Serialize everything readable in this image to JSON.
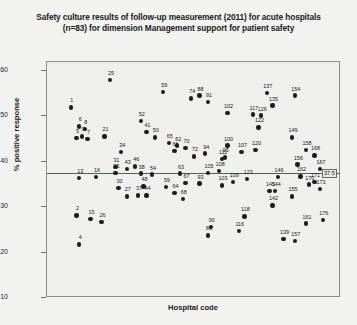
{
  "chart_data": {
    "type": "scatter",
    "title": "Safety culture results of follow-up measurement (2011) for acute hospitals (n=83) for dimension Management support for patient safety",
    "title_line1": "Safety culture results of follow-up measurement (2011) for acute hospitals",
    "title_line2": "(n=83) for dimension Management support for patient safety",
    "xlabel": "Hospital code",
    "ylabel": "% positive response",
    "ylim": [
      10,
      62
    ],
    "yticks": [
      10,
      20,
      30,
      40,
      50,
      60
    ],
    "ytick_labels": [
      "10",
      "20",
      "30",
      "40",
      "50",
      "60"
    ],
    "grid": false,
    "legend": null,
    "reference_line": {
      "value": 37.5,
      "label": "37.5",
      "orientation": "horizontal"
    },
    "point_label_field": "Hospital code",
    "points": [
      {
        "label": "1",
        "x": 6,
        "y": 52.0
      },
      {
        "label": "25",
        "x": 20,
        "y": 58.0
      },
      {
        "label": "6",
        "x": 9,
        "y": 47.8
      },
      {
        "label": "8",
        "x": 11,
        "y": 47.2
      },
      {
        "label": "5",
        "x": 8,
        "y": 45.2
      },
      {
        "label": "9",
        "x": 10,
        "y": 45.6
      },
      {
        "label": "7",
        "x": 12,
        "y": 45.0
      },
      {
        "label": "21",
        "x": 18,
        "y": 45.6
      },
      {
        "label": "34",
        "x": 24,
        "y": 42.2
      },
      {
        "label": "31",
        "x": 22,
        "y": 38.8
      },
      {
        "label": "13",
        "x": 9,
        "y": 36.4
      },
      {
        "label": "16",
        "x": 15,
        "y": 36.6
      },
      {
        "label": "35",
        "x": 22,
        "y": 37.5
      },
      {
        "label": "43",
        "x": 26,
        "y": 38.4
      },
      {
        "label": "46",
        "x": 29,
        "y": 39.0
      },
      {
        "label": "38",
        "x": 31,
        "y": 37.4
      },
      {
        "label": "54",
        "x": 35,
        "y": 37.2
      },
      {
        "label": "30",
        "x": 23,
        "y": 34.2
      },
      {
        "label": "48",
        "x": 32,
        "y": 34.6
      },
      {
        "label": "27",
        "x": 26,
        "y": 32.4
      },
      {
        "label": "37",
        "x": 30,
        "y": 32.6
      },
      {
        "label": "44",
        "x": 33,
        "y": 32.6
      },
      {
        "label": "15",
        "x": 13,
        "y": 27.4
      },
      {
        "label": "26",
        "x": 17,
        "y": 26.8
      },
      {
        "label": "2",
        "x": 8,
        "y": 28.2
      },
      {
        "label": "4",
        "x": 9,
        "y": 21.8
      },
      {
        "label": "59",
        "x": 39,
        "y": 55.4
      },
      {
        "label": "52",
        "x": 31,
        "y": 49.0
      },
      {
        "label": "88",
        "x": 52,
        "y": 54.6
      },
      {
        "label": "74",
        "x": 49,
        "y": 54.0
      },
      {
        "label": "91",
        "x": 55,
        "y": 53.2
      },
      {
        "label": "102",
        "x": 62,
        "y": 50.8
      },
      {
        "label": "50",
        "x": 36,
        "y": 45.4
      },
      {
        "label": "41",
        "x": 33,
        "y": 46.6
      },
      {
        "label": "65",
        "x": 41,
        "y": 44.2
      },
      {
        "label": "62",
        "x": 44,
        "y": 43.6
      },
      {
        "label": "70",
        "x": 47,
        "y": 43.0
      },
      {
        "label": "61",
        "x": 43,
        "y": 42.4
      },
      {
        "label": "100",
        "x": 62,
        "y": 43.6
      },
      {
        "label": "107",
        "x": 67,
        "y": 42.2
      },
      {
        "label": "95",
        "x": 61,
        "y": 41.0
      },
      {
        "label": "72",
        "x": 50,
        "y": 41.2
      },
      {
        "label": "94",
        "x": 54,
        "y": 41.8
      },
      {
        "label": "111",
        "x": 60,
        "y": 40.6
      },
      {
        "label": "63",
        "x": 45,
        "y": 37.4
      },
      {
        "label": "105",
        "x": 55,
        "y": 37.6
      },
      {
        "label": "108",
        "x": 59,
        "y": 38.0
      },
      {
        "label": "67",
        "x": 47,
        "y": 35.4
      },
      {
        "label": "93",
        "x": 52,
        "y": 35.2
      },
      {
        "label": "103",
        "x": 60,
        "y": 34.8
      },
      {
        "label": "109",
        "x": 64,
        "y": 35.6
      },
      {
        "label": "59b",
        "x": 40,
        "y": 34.4
      },
      {
        "label": "64",
        "x": 43,
        "y": 33.2
      },
      {
        "label": "68",
        "x": 46,
        "y": 31.8
      },
      {
        "label": "90",
        "x": 56,
        "y": 25.6
      },
      {
        "label": "89",
        "x": 55,
        "y": 23.8
      },
      {
        "label": "116",
        "x": 66,
        "y": 24.8
      },
      {
        "label": "137",
        "x": 76,
        "y": 55.2
      },
      {
        "label": "154",
        "x": 86,
        "y": 54.6
      },
      {
        "label": "135",
        "x": 78,
        "y": 52.4
      },
      {
        "label": "117",
        "x": 71,
        "y": 50.4
      },
      {
        "label": "126",
        "x": 74,
        "y": 50.2
      },
      {
        "label": "122",
        "x": 73,
        "y": 47.6
      },
      {
        "label": "149",
        "x": 85,
        "y": 45.4
      },
      {
        "label": "120",
        "x": 72,
        "y": 42.6
      },
      {
        "label": "158",
        "x": 90,
        "y": 42.6
      },
      {
        "label": "168",
        "x": 93,
        "y": 41.4
      },
      {
        "label": "156",
        "x": 87,
        "y": 39.4
      },
      {
        "label": "167",
        "x": 95,
        "y": 38.4
      },
      {
        "label": "123",
        "x": 69,
        "y": 36.2
      },
      {
        "label": "146",
        "x": 80,
        "y": 36.6
      },
      {
        "label": "162",
        "x": 88,
        "y": 36.8
      },
      {
        "label": "171",
        "x": 93,
        "y": 35.6
      },
      {
        "label": "170",
        "x": 91,
        "y": 35.0
      },
      {
        "label": "173",
        "x": 95,
        "y": 34.0
      },
      {
        "label": "145",
        "x": 77,
        "y": 33.6
      },
      {
        "label": "144",
        "x": 79,
        "y": 33.6
      },
      {
        "label": "155",
        "x": 85,
        "y": 32.4
      },
      {
        "label": "142",
        "x": 78,
        "y": 30.4
      },
      {
        "label": "118",
        "x": 68,
        "y": 28.0
      },
      {
        "label": "176",
        "x": 96,
        "y": 27.2
      },
      {
        "label": "161",
        "x": 90,
        "y": 26.4
      },
      {
        "label": "139",
        "x": 82,
        "y": 23.0
      },
      {
        "label": "157",
        "x": 86,
        "y": 22.6
      }
    ]
  }
}
